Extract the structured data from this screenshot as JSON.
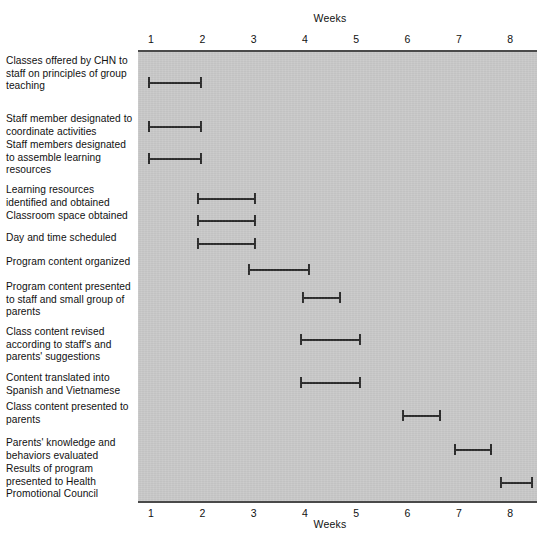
{
  "chart_data": {
    "type": "bar",
    "title": "",
    "xlabel": "Weeks",
    "ylabel": "",
    "axis_caption_top": "Weeks",
    "axis_caption_bottom": "Weeks",
    "xlim": [
      0.75,
      8.6
    ],
    "grid": false,
    "legend": false,
    "xticks": [
      1,
      2,
      3,
      4,
      5,
      6,
      7,
      8
    ],
    "xtick_labels": [
      "1",
      "2",
      "3",
      "4",
      "5",
      "6",
      "7",
      "8"
    ],
    "plot_background": "#c9c9c9",
    "bar_color": "#2b2b2b",
    "categories": [
      "Classes offered by CHN to staff on principles of group teaching",
      "Staff member designated to coordinate activities",
      "Staff members designated to assemble learning resources",
      "Learning resources identified and obtained",
      "Classroom space obtained",
      "Day and time scheduled",
      "Program content organized",
      "Program content presented to staff and small group of parents",
      "Class content revised according to staff's and parents' suggestions",
      "Content translated into Spanish and Vietnamese",
      "Class content presented to parents",
      "Parents' knowledge and behaviors evaluated",
      "Results of program presented to Health Promotional Council"
    ],
    "tasks": [
      {
        "label": "Classes offered by CHN to staff on principles of group teaching",
        "start": 0.95,
        "end": 2.0
      },
      {
        "label": "Staff member designated to coordinate activities",
        "start": 0.95,
        "end": 2.0
      },
      {
        "label": "Staff members designated to assemble learning resources",
        "start": 0.95,
        "end": 2.0
      },
      {
        "label": "Learning resources identified and obtained",
        "start": 1.9,
        "end": 3.05
      },
      {
        "label": "Classroom space obtained",
        "start": 1.9,
        "end": 3.05
      },
      {
        "label": "Day and time scheduled",
        "start": 1.9,
        "end": 3.05
      },
      {
        "label": "Program content organized",
        "start": 2.9,
        "end": 4.1
      },
      {
        "label": "Program content presented to staff and small group of parents",
        "start": 3.95,
        "end": 4.7
      },
      {
        "label": "Class content revised according to staff's and parents' suggestions",
        "start": 3.9,
        "end": 5.1
      },
      {
        "label": "Content translated into Spanish and Vietnamese",
        "start": 3.9,
        "end": 5.1
      },
      {
        "label": "Class content presented to parents",
        "start": 5.9,
        "end": 6.65
      },
      {
        "label": "Parents' knowledge and behaviors evaluated",
        "start": 6.9,
        "end": 7.65
      },
      {
        "label": "Results of program presented to Health Promotional Council",
        "start": 7.8,
        "end": 8.45
      }
    ]
  },
  "labels": [
    {
      "text": "Classes offered by CHN to staff on principles of group teaching",
      "top": 5
    },
    {
      "text": "Staff member designated to coordinate activities",
      "top": 63
    },
    {
      "text": "Staff members designated to assemble learning resources",
      "top": 89
    },
    {
      "text": "Learning resources identified and obtained",
      "top": 134
    },
    {
      "text": "Classroom space obtained",
      "top": 160
    },
    {
      "text": "Day and time scheduled",
      "top": 182
    },
    {
      "text": "Program content organized",
      "top": 206
    },
    {
      "text": "Program content presented to staff and small group of parents",
      "top": 231
    },
    {
      "text": "Class content revised according to staff's and parents' suggestions",
      "top": 276
    },
    {
      "text": "Content translated into Spanish and Vietnamese",
      "top": 322
    },
    {
      "text": "Class content presented to parents",
      "top": 351
    },
    {
      "text": "Parents' knowledge and behaviors evaluated",
      "top": 387
    },
    {
      "text": "Results of program presented to Health Promotional Council",
      "top": 413
    }
  ],
  "bar_rows": [
    {
      "top": 25
    },
    {
      "top": 69
    },
    {
      "top": 101
    },
    {
      "top": 141
    },
    {
      "top": 163
    },
    {
      "top": 186
    },
    {
      "top": 212
    },
    {
      "top": 240
    },
    {
      "top": 282
    },
    {
      "top": 325
    },
    {
      "top": 358
    },
    {
      "top": 392
    },
    {
      "top": 425
    }
  ]
}
